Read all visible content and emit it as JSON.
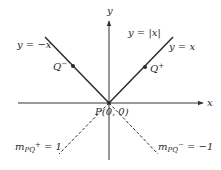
{
  "diagram": {
    "axes": {
      "x_label": "x",
      "y_label": "y",
      "origin": {
        "px": 109,
        "py": 103
      },
      "x_axis": {
        "x1": 18,
        "x2": 203
      },
      "y_axis": {
        "y1": 160,
        "y2": 21
      }
    },
    "curves": [
      {
        "id": "left-branch",
        "label": "y = −x",
        "x1": 45,
        "y1": 37,
        "x2": 109,
        "y2": 103,
        "style": "solid"
      },
      {
        "id": "right-branch",
        "label": "y = x",
        "x1": 173,
        "y1": 37,
        "x2": 109,
        "y2": 103,
        "style": "solid"
      }
    ],
    "function_label": "y = |x|",
    "points": [
      {
        "id": "q-minus",
        "label": "Q",
        "sup": "−",
        "px": 73,
        "py": 66
      },
      {
        "id": "q-plus",
        "label": "Q",
        "sup": "+",
        "px": 145,
        "py": 67
      },
      {
        "id": "p-origin",
        "label": "P(0, 0)",
        "px": 109,
        "py": 103
      }
    ],
    "secant_lines": [
      {
        "id": "slope-pq-plus",
        "label_m": "m",
        "label_sub": "PQ",
        "label_sup": "+",
        "label_rest": " = 1",
        "x1": 109,
        "y1": 103,
        "x2": 59,
        "y2": 154,
        "style": "dashed"
      },
      {
        "id": "slope-pq-minus",
        "label_m": "m",
        "label_sub": "PQ",
        "label_sup": "−",
        "label_rest": " = −1",
        "x1": 109,
        "y1": 103,
        "x2": 158,
        "y2": 154,
        "style": "dashed"
      }
    ],
    "colors": {
      "line": "#2b2b2b",
      "axis": "#333333",
      "text": "#2a2a2a",
      "background": "#ffffff"
    }
  }
}
